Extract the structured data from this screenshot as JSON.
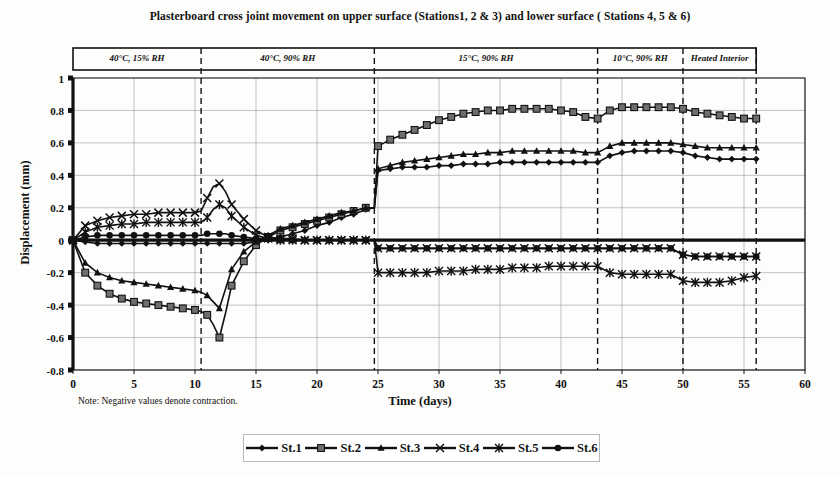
{
  "chart_data": {
    "type": "line",
    "title": "Plasterboard cross joint movement on upper surface (Stations1, 2 & 3) and lower surface ( Stations 4, 5 & 6)",
    "xlabel": "Time (days)",
    "ylabel": "Displacement (mm)",
    "note": "Note: Negative values denote contraction.",
    "xlim": [
      0,
      60
    ],
    "ylim": [
      -0.8,
      1
    ],
    "xticks": [
      0,
      5,
      10,
      15,
      20,
      25,
      30,
      35,
      40,
      45,
      50,
      55,
      60
    ],
    "yticks": [
      -0.8,
      -0.6,
      -0.4,
      -0.2,
      0,
      0.2,
      0.4,
      0.6,
      0.8,
      1
    ],
    "grid": true,
    "legend_position": "bottom",
    "data_end_x": 56,
    "phases": [
      {
        "label": "40°C, 15% RH",
        "start": 0,
        "end": 10.5
      },
      {
        "label": "40°C, 90% RH",
        "start": 10.5,
        "end": 24.7
      },
      {
        "label": "15°C, 90% RH",
        "start": 24.7,
        "end": 43.0
      },
      {
        "label": "10°C, 90% RH",
        "start": 43.0,
        "end": 50.0
      },
      {
        "label": "Heated Interior",
        "start": 50.0,
        "end": 56.0
      }
    ],
    "phase_dividers": [
      10.5,
      24.7,
      43.0,
      50.0,
      56.0
    ],
    "x": [
      0,
      1,
      2,
      3,
      4,
      5,
      6,
      7,
      8,
      9,
      10,
      10.5,
      11,
      11.5,
      12,
      12.5,
      13,
      14,
      15,
      16,
      17,
      18,
      19,
      20,
      21,
      22,
      23,
      24,
      24.7,
      25,
      26,
      27,
      28,
      29,
      30,
      31,
      32,
      33,
      34,
      35,
      36,
      37,
      38,
      39,
      40,
      41,
      42,
      43,
      44,
      45,
      46,
      47,
      48,
      49,
      50,
      51,
      52,
      53,
      54,
      55,
      56
    ],
    "series": [
      {
        "name": "St.1",
        "marker": "diamond",
        "values": [
          0,
          -0.01,
          -0.02,
          -0.02,
          -0.02,
          -0.02,
          -0.02,
          -0.02,
          -0.02,
          -0.02,
          -0.02,
          -0.02,
          -0.02,
          -0.02,
          -0.02,
          -0.02,
          -0.02,
          -0.02,
          -0.01,
          0.0,
          0.02,
          0.04,
          0.06,
          0.09,
          0.11,
          0.14,
          0.16,
          0.19,
          0.2,
          0.43,
          0.44,
          0.45,
          0.45,
          0.45,
          0.46,
          0.46,
          0.47,
          0.47,
          0.47,
          0.48,
          0.48,
          0.48,
          0.48,
          0.48,
          0.48,
          0.48,
          0.48,
          0.48,
          0.52,
          0.54,
          0.55,
          0.55,
          0.55,
          0.55,
          0.54,
          0.52,
          0.51,
          0.5,
          0.5,
          0.5,
          0.5
        ]
      },
      {
        "name": "St.2",
        "marker": "square",
        "values": [
          0,
          -0.2,
          -0.28,
          -0.33,
          -0.36,
          -0.38,
          -0.39,
          -0.4,
          -0.41,
          -0.42,
          -0.43,
          -0.44,
          -0.46,
          -0.52,
          -0.6,
          -0.45,
          -0.28,
          -0.13,
          -0.03,
          0.02,
          0.06,
          0.08,
          0.1,
          0.12,
          0.14,
          0.16,
          0.18,
          0.2,
          0.2,
          0.58,
          0.62,
          0.65,
          0.68,
          0.71,
          0.74,
          0.76,
          0.78,
          0.79,
          0.8,
          0.8,
          0.81,
          0.81,
          0.81,
          0.81,
          0.8,
          0.79,
          0.76,
          0.75,
          0.8,
          0.82,
          0.82,
          0.82,
          0.82,
          0.82,
          0.81,
          0.79,
          0.78,
          0.77,
          0.76,
          0.75,
          0.75
        ]
      },
      {
        "name": "St.3",
        "marker": "triangle",
        "values": [
          0,
          -0.14,
          -0.2,
          -0.23,
          -0.25,
          -0.26,
          -0.27,
          -0.28,
          -0.29,
          -0.3,
          -0.31,
          -0.32,
          -0.34,
          -0.38,
          -0.42,
          -0.3,
          -0.18,
          -0.07,
          -0.01,
          0.03,
          0.07,
          0.09,
          0.11,
          0.13,
          0.15,
          0.17,
          0.18,
          0.2,
          0.2,
          0.44,
          0.46,
          0.48,
          0.49,
          0.5,
          0.51,
          0.52,
          0.53,
          0.53,
          0.54,
          0.54,
          0.55,
          0.55,
          0.55,
          0.55,
          0.55,
          0.55,
          0.54,
          0.54,
          0.58,
          0.6,
          0.6,
          0.6,
          0.6,
          0.6,
          0.59,
          0.58,
          0.57,
          0.57,
          0.57,
          0.57,
          0.57
        ]
      },
      {
        "name": "St.4",
        "marker": "cross",
        "values": [
          0,
          0.09,
          0.12,
          0.14,
          0.15,
          0.16,
          0.16,
          0.17,
          0.17,
          0.17,
          0.17,
          0.18,
          0.26,
          0.33,
          0.35,
          0.3,
          0.22,
          0.13,
          0.06,
          0.02,
          0.01,
          0.01,
          0.0,
          0.0,
          0.0,
          0.0,
          0.0,
          0.0,
          0.0,
          -0.05,
          -0.05,
          -0.05,
          -0.05,
          -0.05,
          -0.05,
          -0.05,
          -0.05,
          -0.05,
          -0.05,
          -0.05,
          -0.05,
          -0.05,
          -0.05,
          -0.05,
          -0.05,
          -0.05,
          -0.05,
          -0.05,
          -0.05,
          -0.05,
          -0.05,
          -0.05,
          -0.05,
          -0.05,
          -0.09,
          -0.1,
          -0.1,
          -0.1,
          -0.1,
          -0.1,
          -0.1
        ]
      },
      {
        "name": "St.5",
        "marker": "star",
        "values": [
          0,
          0.05,
          0.08,
          0.09,
          0.1,
          0.1,
          0.11,
          0.11,
          0.11,
          0.11,
          0.11,
          0.11,
          0.14,
          0.19,
          0.22,
          0.2,
          0.15,
          0.08,
          0.03,
          0.01,
          0.0,
          0.0,
          0.0,
          0.0,
          0.0,
          0.0,
          0.0,
          0.0,
          0.0,
          -0.2,
          -0.2,
          -0.2,
          -0.2,
          -0.2,
          -0.19,
          -0.19,
          -0.19,
          -0.18,
          -0.18,
          -0.18,
          -0.17,
          -0.17,
          -0.17,
          -0.16,
          -0.16,
          -0.16,
          -0.16,
          -0.16,
          -0.2,
          -0.21,
          -0.21,
          -0.21,
          -0.21,
          -0.21,
          -0.25,
          -0.26,
          -0.26,
          -0.26,
          -0.25,
          -0.23,
          -0.22
        ]
      },
      {
        "name": "St.6",
        "marker": "circle",
        "values": [
          0,
          0.02,
          0.03,
          0.03,
          0.03,
          0.03,
          0.03,
          0.03,
          0.03,
          0.03,
          0.03,
          0.03,
          0.04,
          0.04,
          0.04,
          0.04,
          0.03,
          0.02,
          0.01,
          0.01,
          0.0,
          0.0,
          0.0,
          0.0,
          0.0,
          0.0,
          0.0,
          0.0,
          0.0,
          -0.05,
          -0.05,
          -0.05,
          -0.05,
          -0.05,
          -0.05,
          -0.05,
          -0.05,
          -0.05,
          -0.05,
          -0.05,
          -0.05,
          -0.05,
          -0.05,
          -0.05,
          -0.05,
          -0.05,
          -0.05,
          -0.05,
          -0.05,
          -0.05,
          -0.05,
          -0.05,
          -0.05,
          -0.05,
          -0.09,
          -0.1,
          -0.1,
          -0.1,
          -0.1,
          -0.1,
          -0.1
        ]
      }
    ]
  }
}
